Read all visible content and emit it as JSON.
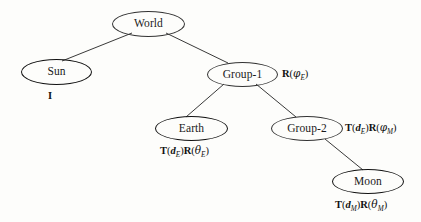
{
  "diagram": {
    "nodes": [
      {
        "id": "world",
        "label": "World",
        "kind": "group",
        "transform": ""
      },
      {
        "id": "sun",
        "label": "Sun",
        "kind": "object",
        "transform": "I"
      },
      {
        "id": "group1",
        "label": "Group-1",
        "kind": "group",
        "transform": "R(φE)"
      },
      {
        "id": "earth",
        "label": "Earth",
        "kind": "object",
        "transform": "T(dE)R(θE)"
      },
      {
        "id": "group2",
        "label": "Group-2",
        "kind": "group",
        "transform": "T(dE)R(φM)"
      },
      {
        "id": "moon",
        "label": "Moon",
        "kind": "object",
        "transform": "T(dM)R(θM)"
      }
    ],
    "edges": [
      {
        "from": "world",
        "to": "sun"
      },
      {
        "from": "world",
        "to": "group1"
      },
      {
        "from": "group1",
        "to": "earth"
      },
      {
        "from": "group1",
        "to": "group2"
      },
      {
        "from": "group2",
        "to": "moon"
      }
    ],
    "colors": {
      "stroke": "#111111",
      "text": "#1a1a1a",
      "background": "#fdfdfb"
    }
  }
}
